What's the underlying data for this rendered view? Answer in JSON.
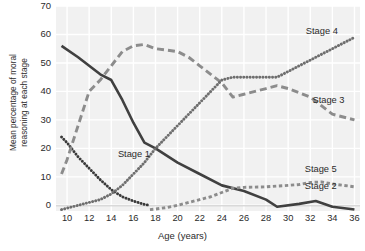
{
  "chart_data": {
    "type": "line",
    "title": "",
    "xlabel": "Age (years)",
    "ylabel": "Mean percentage of moral reasoning at each stage",
    "ylabel_line1": "Mean percentage of moral",
    "ylabel_line2": "reasoning at each stage",
    "xlim": [
      9,
      36.5
    ],
    "ylim": [
      -2,
      70
    ],
    "grid": true,
    "legend_position": "inline-right",
    "xticks": [
      10,
      12,
      14,
      16,
      18,
      20,
      22,
      24,
      26,
      28,
      30,
      32,
      34,
      36
    ],
    "yticks": [
      0,
      10,
      20,
      30,
      40,
      50,
      60,
      70
    ],
    "background": "#f1f1f1",
    "gridline_color": "#ffffff",
    "series": [
      {
        "name": "Stage 1",
        "label": "Stage 1",
        "color": "#3a3a3a",
        "style": "dotted",
        "label_x": 14.6,
        "label_y": 17.5,
        "x": [
          9.5,
          10,
          11,
          12,
          13,
          14,
          15,
          16,
          17,
          17.5
        ],
        "values": [
          24,
          22,
          17,
          13,
          9,
          5.5,
          3,
          1.5,
          0.3,
          0
        ]
      },
      {
        "name": "Stage 2",
        "label": "Stage 2",
        "color": "#404040",
        "style": "solid",
        "label_x": 31.5,
        "label_y": 6.5,
        "x": [
          9.5,
          11,
          12,
          13,
          14,
          15,
          16,
          17,
          18,
          20,
          22,
          24,
          26,
          28,
          29,
          31,
          32.5,
          34,
          36
        ],
        "values": [
          56,
          52,
          49,
          46,
          44,
          37,
          29,
          22,
          20,
          15,
          11,
          7,
          5,
          2,
          -0.5,
          0.5,
          1.5,
          -0.5,
          -1.5
        ]
      },
      {
        "name": "Stage 3",
        "label": "Stage 3",
        "color": "#8c8c8c",
        "style": "long-dash",
        "label_x": 32.2,
        "label_y": 36.5,
        "x": [
          9.5,
          10,
          11,
          12,
          13,
          14,
          15,
          16,
          17,
          18,
          19,
          20,
          21,
          22,
          23,
          24,
          25,
          26,
          28,
          29,
          30,
          32,
          33,
          34,
          36
        ],
        "values": [
          11,
          16,
          28,
          40,
          44,
          49,
          54,
          56,
          56.5,
          55,
          54.5,
          54,
          52,
          49,
          46,
          43,
          38,
          39,
          41,
          42,
          41,
          38,
          35,
          32,
          30
        ]
      },
      {
        "name": "Stage 4",
        "label": "Stage 4",
        "color": "#6e6e6e",
        "style": "dotted",
        "label_x": 31.6,
        "label_y": 61,
        "x": [
          9.5,
          11,
          12,
          13,
          14,
          15,
          16,
          17,
          18,
          19,
          20,
          21,
          22,
          23,
          24,
          25,
          26,
          27,
          28,
          29,
          30,
          32,
          34,
          36
        ],
        "values": [
          -1.5,
          0,
          1,
          2,
          4,
          7,
          11,
          15,
          20,
          24,
          28,
          32,
          36,
          40,
          44,
          45,
          45,
          45,
          45,
          45,
          47,
          51,
          55,
          59
        ]
      },
      {
        "name": "Stage 5",
        "label": "Stage 5",
        "color": "#8c8c8c",
        "style": "short-dash",
        "label_x": 31.5,
        "label_y": 12.5,
        "x": [
          17.5,
          18,
          19,
          20,
          21,
          22,
          23,
          24,
          25,
          26,
          28,
          30,
          31,
          32,
          33,
          34,
          36
        ],
        "values": [
          -1.5,
          -1.3,
          -0.8,
          0,
          1,
          2,
          3,
          4.5,
          6,
          6.3,
          6.5,
          7,
          7.3,
          8,
          8.2,
          7.5,
          6.5
        ]
      }
    ]
  }
}
